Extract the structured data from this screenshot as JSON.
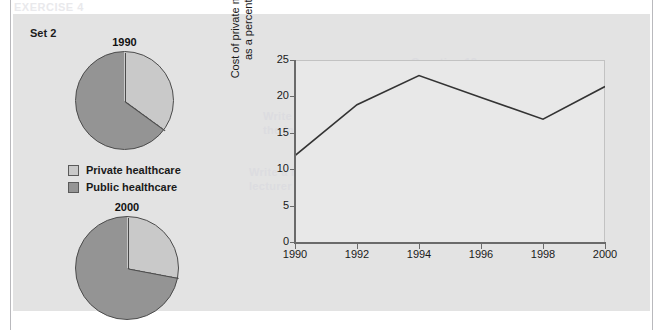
{
  "page": {
    "top_cut_text": "EXERCISE 4"
  },
  "figure": {
    "set_label": "Set 2",
    "background_bleed": [
      {
        "text": "Question 12",
        "x": 398,
        "y": 42
      },
      {
        "text": "Look at the charts below",
        "x": 360,
        "y": 58
      },
      {
        "text": "Write a report describing",
        "x": 250,
        "y": 96
      },
      {
        "text": "the information shown",
        "x": 250,
        "y": 110
      },
      {
        "text": "Write a report for a university",
        "x": 236,
        "y": 152
      },
      {
        "text": "lecturer describing the information",
        "x": 236,
        "y": 166
      }
    ],
    "pies": [
      {
        "title": "1990",
        "slices": [
          {
            "label": "Private healthcare",
            "value": 35,
            "color": "#c9c9c9"
          },
          {
            "label": "Public healthcare",
            "value": 65,
            "color": "#949494"
          }
        ]
      },
      {
        "title": "2000",
        "slices": [
          {
            "label": "Private healthcare",
            "value": 28,
            "color": "#c9c9c9"
          },
          {
            "label": "Public healthcare",
            "value": 72,
            "color": "#949494"
          }
        ]
      }
    ],
    "legend": [
      {
        "label": "Private healthcare",
        "color": "#c9c9c9"
      },
      {
        "label": "Public healthcare",
        "color": "#949494"
      }
    ]
  },
  "chart_data": {
    "type": "line",
    "title": "",
    "xlabel": "",
    "ylabel": "Cost of private medical insurance as a percentage of wages",
    "x": [
      1990,
      1992,
      1994,
      1996,
      1998,
      2000
    ],
    "values": [
      12,
      19,
      23,
      20,
      17,
      21.5
    ],
    "xticks": [
      "1990",
      "1992",
      "1994",
      "1996",
      "1998",
      "2000"
    ],
    "yticks": [
      "0",
      "5",
      "10",
      "15",
      "20",
      "25"
    ],
    "xlim": [
      1990,
      2000
    ],
    "ylim": [
      0,
      25
    ],
    "grid": false,
    "legend_position": "none",
    "line_color": "#333333"
  },
  "colors": {
    "panel_bg": "#e3e3e3",
    "plot_bg": "#e8e8e8",
    "light_slice": "#c9c9c9",
    "dark_slice": "#949494",
    "axis": "#6a6a6a",
    "text": "#1a1a1a"
  }
}
